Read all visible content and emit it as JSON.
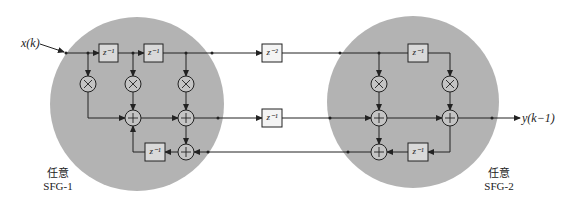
{
  "diagram": {
    "input_label": "x(k)",
    "output_label": "y(k−1)",
    "regions": [
      {
        "id": "sfg1",
        "line1": "任意",
        "line2": "SFG-1",
        "fill": "#b3b3b3"
      },
      {
        "id": "sfg2",
        "line1": "任意",
        "line2": "SFG-2",
        "fill": "#b3b3b3"
      }
    ],
    "delays": {
      "sfg1_top_1": "z⁻¹",
      "sfg1_top_2": "z⁻¹",
      "cut_top": "z⁻²",
      "cut_mid": "z⁻¹",
      "sfg1_bottom": "z⁻¹",
      "sfg2_top": "z⁻¹",
      "sfg2_bottom": "z⁻¹"
    },
    "multiplier_symbol": "×",
    "adder_symbol": "+",
    "colors": {
      "line": "#222222",
      "box_fill": "#d9d9d9",
      "node_fill": "#c4c4c4"
    }
  }
}
